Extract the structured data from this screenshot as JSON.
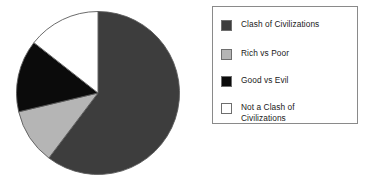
{
  "chart_data": {
    "type": "pie",
    "title": "",
    "categories": [
      "Clash of Civilizations",
      "Rich vs Poor",
      "Good vs Evil",
      "Not a Clash of Civilizations"
    ],
    "values": [
      60.3,
      11.0,
      14.3,
      14.4
    ],
    "units": "percent",
    "start_angle_deg": 0,
    "direction": "clockwise",
    "slice_angles_deg": [
      217,
      39.5,
      51.5,
      52
    ],
    "colors": [
      "#3d3d3d",
      "#b5b5b5",
      "#0b0b0b",
      "#ffffff"
    ],
    "slice_edge_color": "#5a5a5a",
    "legend": {
      "position": "right",
      "border_color": "#8a8a8a",
      "background": "#ffffff",
      "entries": [
        {
          "label": "Clash of Civilizations",
          "color": "#3d3d3d",
          "swatch_border": "#6e6e6e"
        },
        {
          "label": "Rich vs Poor",
          "color": "#b5b5b5",
          "swatch_border": "#6e6e6e"
        },
        {
          "label": "Good vs Evil",
          "color": "#0b0b0b",
          "swatch_border": "#6e6e6e"
        },
        {
          "label": "Not a Clash of\nCivilizations",
          "color": "#ffffff",
          "swatch_border": "#6e6e6e"
        }
      ]
    },
    "xlabel": "",
    "ylabel": "",
    "grid": false
  }
}
